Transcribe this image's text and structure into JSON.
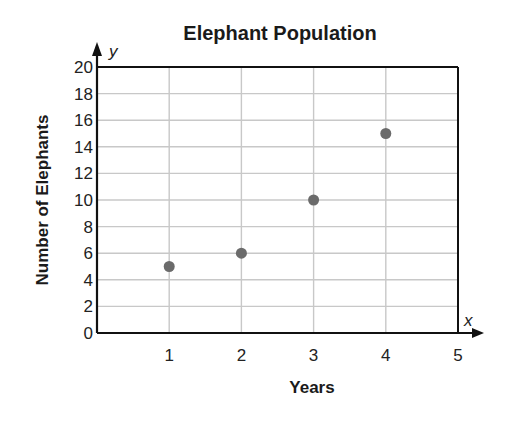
{
  "chart_data": {
    "type": "scatter",
    "title": "Elephant Population",
    "xlabel": "Years",
    "ylabel": "Number of Elephants",
    "x_axis_variable": "x",
    "y_axis_variable": "y",
    "x": [
      1,
      2,
      3,
      4
    ],
    "y": [
      5,
      6,
      10,
      15
    ],
    "points": [
      {
        "x": 1,
        "y": 5
      },
      {
        "x": 2,
        "y": 6
      },
      {
        "x": 3,
        "y": 10
      },
      {
        "x": 4,
        "y": 15
      }
    ],
    "xlim": [
      0,
      5
    ],
    "ylim": [
      0,
      20
    ],
    "x_ticks": [
      "1",
      "2",
      "3",
      "4",
      "5"
    ],
    "y_ticks": [
      "0",
      "2",
      "4",
      "6",
      "8",
      "10",
      "12",
      "14",
      "16",
      "18",
      "20"
    ],
    "grid": true,
    "legend": null,
    "colors": {
      "points": "#6b6b6b",
      "grid": "#c8c8c8",
      "axis": "#111111"
    }
  }
}
